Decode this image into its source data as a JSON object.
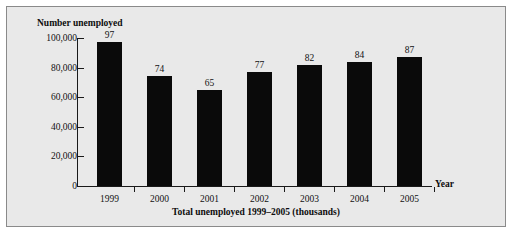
{
  "chart_data": {
    "type": "bar",
    "title": "",
    "caption": "Total unemployed 1999–2005 (thousands)",
    "ylabel": "Number unemployed",
    "xlabel": "Year",
    "categories": [
      "1999",
      "2000",
      "2001",
      "2002",
      "2003",
      "2004",
      "2005"
    ],
    "values": [
      97,
      74,
      65,
      77,
      82,
      84,
      87
    ],
    "value_unit": "thousands",
    "ylim": [
      0,
      100000
    ],
    "y_ticks": [
      0,
      20000,
      40000,
      60000,
      80000,
      100000
    ],
    "y_tick_labels": [
      "0",
      "20,000",
      "40,000",
      "60,000",
      "80,000",
      "100,000"
    ],
    "grid": false,
    "legend": false,
    "bar_color": "#0a0a0a",
    "background_color": "#e9e9e9",
    "axis_color": "#1a1a1a"
  }
}
